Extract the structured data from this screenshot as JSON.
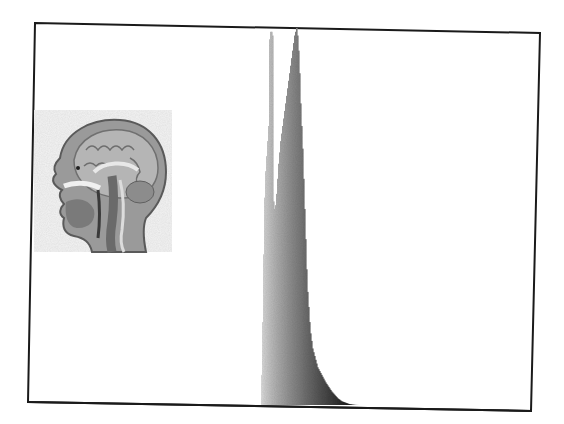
{
  "chart_data": {
    "type": "bar",
    "title": "",
    "xlabel": "",
    "ylabel": "",
    "grid": false,
    "legend": null,
    "x_bin_start_px": 261,
    "bin_width_px": 1,
    "baseline_px": 405,
    "top_px": 28,
    "ylim": [
      0,
      100
    ],
    "heights_pct": [
      8,
      22,
      40,
      55,
      62,
      66,
      70,
      74,
      97,
      99,
      99,
      98,
      54,
      52,
      53,
      56,
      60,
      64,
      67,
      70,
      72,
      74,
      76,
      78,
      80,
      82,
      84,
      86,
      88,
      90,
      92,
      94,
      96,
      98,
      99,
      100,
      98,
      94,
      88,
      80,
      74,
      68,
      60,
      52,
      44,
      36,
      30,
      26,
      22,
      19,
      17,
      15,
      14,
      13,
      12,
      11,
      10,
      9.5,
      9,
      8.5,
      8,
      7.5,
      7,
      6.5,
      6,
      5.6,
      5.2,
      4.8,
      4.4,
      4.0,
      3.6,
      3.3,
      3.0,
      2.7,
      2.4,
      2.1,
      1.8,
      1.6,
      1.4,
      1.2,
      1.0,
      0.9,
      0.8,
      0.7,
      0.6,
      0.5,
      0.4,
      0.3,
      0.25,
      0.2,
      0.15,
      0.1,
      0.08,
      0.05,
      0.03,
      0.02,
      0.01,
      0,
      0,
      0,
      0,
      0,
      0,
      0,
      0
    ],
    "peaks": [
      {
        "label": "narrow light spike",
        "x_px": 270,
        "height_pct": 99
      },
      {
        "label": "main peak",
        "x_px": 296,
        "height_pct": 100
      }
    ],
    "color_ramp": {
      "start": "#dcdcdc",
      "end": "#000000"
    }
  },
  "figure": {
    "frame": {
      "top_left": [
        35,
        23
      ],
      "top_right": [
        540,
        33
      ],
      "bottom_right": [
        531,
        411
      ],
      "bottom_left": [
        28,
        402
      ],
      "stroke": "#1a1a1a",
      "stroke_width": 2
    },
    "thumbnail": {
      "label": "sagittal head MRI",
      "x": 34,
      "y": 110,
      "width": 138,
      "height": 142
    }
  }
}
